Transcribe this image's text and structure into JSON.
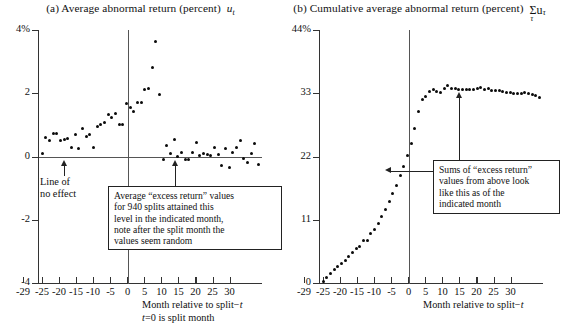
{
  "figure": {
    "background": "#ffffff",
    "dot_color": "#0a0a0a",
    "axis_color": "#333333"
  },
  "panels": [
    {
      "id": "a",
      "title_prefix": "(a) Average abnormal return (percent)",
      "title_symbol": "u",
      "title_symbol_sub": "t",
      "xaxis": {
        "title_line1": "Month relative to split",
        "title_line1_suffix": "t",
        "title_line2_a": "t",
        "title_line2_b": "0 is split month",
        "ticks": [
          -29,
          -25,
          -20,
          -15,
          -10,
          -5,
          0,
          5,
          10,
          15,
          20,
          25,
          30
        ],
        "tick_labels": [
          "-29",
          "-25",
          "-20",
          "-15",
          "-10",
          "-5",
          "0",
          "5",
          "10",
          "15",
          "20",
          "25",
          "30"
        ],
        "range": [
          -30,
          31
        ]
      },
      "yaxis": {
        "ticks": [
          4,
          2,
          0,
          -2,
          -4
        ],
        "tick_labels": [
          "4%",
          "2",
          "0",
          "-2",
          "-4"
        ],
        "range": [
          -4,
          4
        ]
      },
      "annotations": [
        {
          "name": "line-of-no-effect",
          "text_line1": "Line of",
          "text_line2": "no effect",
          "points_to_month": -19
        },
        {
          "name": "excess-return-note",
          "lines": [
            "Average “excess return” values",
            "for 940 splits attained this",
            "level in the indicated month,",
            "note after the split month the",
            "values seem random"
          ],
          "points_to_month": 14
        }
      ]
    },
    {
      "id": "b",
      "title_prefix": "(b) Cumulative average abnormal return (percent)",
      "title_symbol": "Σu",
      "title_symbol_sub": "τ",
      "title_sigma_under": "τ",
      "xaxis": {
        "title_line1": "Month relative to split",
        "title_line1_suffix": "t",
        "ticks": [
          -29,
          -25,
          -20,
          -15,
          -10,
          -5,
          0,
          5,
          10,
          15,
          20,
          25,
          30
        ],
        "tick_labels": [
          "-29",
          "-25",
          "-20",
          "-15",
          "-10",
          "-5",
          "0",
          "5",
          "10",
          "15",
          "20",
          "25",
          "30"
        ],
        "range": [
          -30,
          31
        ]
      },
      "yaxis": {
        "ticks": [
          44,
          33,
          22,
          11,
          0
        ],
        "tick_labels": [
          "44%",
          "33",
          "22",
          "11",
          "0"
        ],
        "range": [
          0,
          44
        ]
      },
      "annotations": [
        {
          "name": "sums-note",
          "lines": [
            "Sums of “excess return”",
            "values from above look",
            "like this as of the",
            "indicated month"
          ],
          "points_to_month": -7,
          "points_to_month_2": 15
        }
      ]
    }
  ],
  "chart_data": [
    {
      "type": "scatter",
      "panel": "a",
      "title": "(a) Average abnormal return (percent) u_t",
      "xlabel": "Month relative to split −t; t=0 is split month",
      "ylabel": "Average abnormal return (percent)",
      "xlim": [
        -30,
        31
      ],
      "ylim": [
        -4,
        4
      ],
      "grid": false,
      "x": [
        -29,
        -28,
        -27,
        -26,
        -25,
        -24,
        -23,
        -22,
        -21,
        -20,
        -19,
        -18,
        -17,
        -16,
        -15,
        -14,
        -13,
        -12,
        -11,
        -10,
        -9,
        -8,
        -7,
        -6,
        -5,
        -4,
        -3,
        -2,
        -1,
        0,
        1,
        2,
        3,
        4,
        5,
        6,
        7,
        8,
        9,
        10,
        11,
        12,
        13,
        14,
        15,
        16,
        17,
        18,
        19,
        20,
        21,
        22,
        23,
        24,
        25,
        26,
        27,
        28,
        29,
        30
      ],
      "y": [
        0.08,
        0.6,
        0.52,
        0.72,
        0.74,
        0.52,
        0.55,
        0.56,
        0.3,
        0.7,
        0.25,
        0.88,
        0.62,
        0.7,
        0.3,
        0.94,
        1.0,
        1.08,
        1.32,
        1.22,
        1.35,
        1.0,
        1.02,
        1.68,
        1.55,
        1.42,
        1.7,
        1.72,
        2.12,
        2.16,
        2.82,
        3.65,
        1.95,
        -0.1,
        0.35,
        0.1,
        0.55,
        0.0,
        0.12,
        -0.1,
        -0.1,
        0.12,
        0.45,
        0.02,
        0.1,
        0.05,
        0.02,
        0.3,
        0.05,
        -0.3,
        0.25,
        -0.35,
        0.12,
        0.28,
        0.5,
        -0.05,
        -0.2,
        0.1,
        0.4,
        -0.25,
        0.3,
        0.08,
        -0.22
      ],
      "zero_line": 0,
      "split_line_x": 0
    },
    {
      "type": "scatter",
      "panel": "b",
      "title": "(b) Cumulative average abnormal return (percent) Σu_τ",
      "xlabel": "Month relative to split −t",
      "ylabel": "Cumulative average abnormal return (percent)",
      "xlim": [
        -30,
        31
      ],
      "ylim": [
        0,
        44
      ],
      "grid": false,
      "x": [
        -29,
        -28,
        -27,
        -26,
        -25,
        -24,
        -23,
        -22,
        -21,
        -20,
        -19,
        -18,
        -17,
        -16,
        -15,
        -14,
        -13,
        -12,
        -11,
        -10,
        -9,
        -8,
        -7,
        -6,
        -5,
        -4,
        -3,
        -2,
        -1,
        0,
        1,
        2,
        3,
        4,
        5,
        6,
        7,
        8,
        9,
        10,
        11,
        12,
        13,
        14,
        15,
        16,
        17,
        18,
        19,
        20,
        21,
        22,
        23,
        24,
        25,
        26,
        27,
        28,
        29,
        30
      ],
      "y": [
        0.3,
        1.0,
        1.7,
        2.3,
        2.9,
        3.4,
        4.0,
        4.6,
        5.3,
        6.0,
        6.4,
        7.4,
        7.4,
        8.6,
        9.3,
        10.3,
        11.5,
        12.8,
        14.2,
        15.5,
        16.9,
        18.7,
        20.3,
        22.1,
        24.3,
        26.8,
        29.8,
        31.9,
        32.5,
        33.3,
        33.6,
        33.3,
        33.2,
        33.8,
        34.3,
        33.9,
        33.8,
        33.7,
        33.7,
        33.7,
        33.6,
        33.6,
        33.8,
        34.0,
        33.6,
        33.9,
        33.5,
        33.4,
        33.5,
        33.3,
        33.2,
        33.2,
        33.0,
        32.9,
        33.0,
        33.1,
        32.9,
        32.8,
        32.6,
        32.2
      ],
      "split_line_x": 0
    }
  ]
}
